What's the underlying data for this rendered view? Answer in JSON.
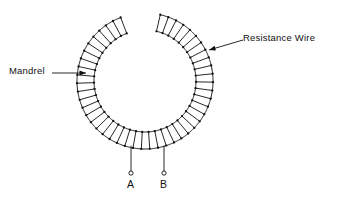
{
  "figure": {
    "type": "technical-line-diagram",
    "background_color": "#ffffff",
    "line_color": "#111111",
    "width": 338,
    "height": 204
  },
  "annotations": {
    "mandrel": {
      "label": "Mandrel",
      "leader_from": {
        "x": 52,
        "y": 73
      },
      "leader_to": {
        "x": 86,
        "y": 73
      },
      "arrow_direction": "right",
      "points_at": "inner-arc"
    },
    "resistance_wire": {
      "label": "Resistance Wire",
      "leader_from": {
        "x": 243,
        "y": 40
      },
      "leader_to": {
        "x": 209,
        "y": 50
      },
      "arrow_direction": "down-left",
      "points_at": "outer-arc"
    }
  },
  "terminals": [
    {
      "id": "A",
      "label": "A",
      "lead_top": {
        "x": 131,
        "y": 146
      },
      "lead_bottom": {
        "x": 131,
        "y": 171
      },
      "node_radius": 2.1,
      "label_x": 127,
      "label_y": 179
    },
    {
      "id": "B",
      "label": "B",
      "lead_top": {
        "x": 164,
        "y": 146
      },
      "lead_bottom": {
        "x": 164,
        "y": 171
      },
      "node_radius": 2.1,
      "label_x": 160,
      "label_y": 179
    }
  ],
  "coil": {
    "center": {
      "x": 145,
      "y": 81
    },
    "outer_radius": 68,
    "inner_radius": 51,
    "turns": 46,
    "gap_label": "open gap at bottom between terminal leads",
    "start_angle_deg": 77,
    "sweep_deg": 326,
    "junction_dot_radius": 1.15,
    "arc_stroke_width": 0.95,
    "rung_stroke_width": 0.9
  },
  "colors": {
    "ink": "#111111",
    "paper": "#ffffff"
  }
}
